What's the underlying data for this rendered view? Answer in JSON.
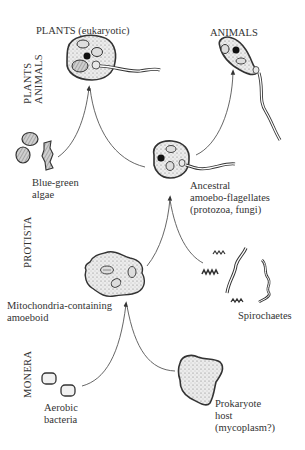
{
  "diagram": {
    "kingdoms": {
      "plants_animals": [
        "PLANTS",
        "ANIMALS"
      ],
      "protista": "PROTISTA",
      "monera": "MONERA"
    },
    "nodes": {
      "plants": {
        "label": "PLANTS (eukaryotic)"
      },
      "animals": {
        "label": "ANIMALS"
      },
      "blue_green_algae": {
        "label_lines": [
          "Blue-green",
          "algae"
        ]
      },
      "ancestral": {
        "label_lines": [
          "Ancestral",
          "amoebo-flagellates",
          "(protozoa, fungi)"
        ]
      },
      "mito_amoeboid": {
        "label_lines": [
          "Mitochondria-containing",
          "amoeboid"
        ]
      },
      "spirochaetes": {
        "label": "Spirochaetes"
      },
      "aerobic_bacteria": {
        "label_lines": [
          "Aerobic",
          "bacteria"
        ]
      },
      "prokaryote_host": {
        "label_lines": [
          "Prokaryote",
          "host",
          "(mycoplasm?)"
        ]
      }
    },
    "colors": {
      "ink": "#333333",
      "stipple": "#bdbdbd",
      "background": "#ffffff"
    }
  }
}
